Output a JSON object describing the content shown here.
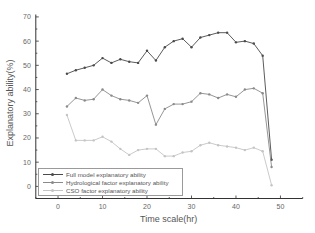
{
  "chart_data": {
    "type": "line",
    "title": "",
    "xlabel": "Time scale(hr)",
    "ylabel": "Explanatory ability(%)",
    "xlim": [
      -5,
      55
    ],
    "ylim": [
      -5,
      71
    ],
    "xticks": [
      0,
      10,
      20,
      30,
      40,
      50
    ],
    "yticks": [
      0,
      10,
      20,
      30,
      40,
      50,
      60,
      70
    ],
    "grid": false,
    "legend_position": "lower left",
    "x": [
      2,
      4,
      6,
      8,
      10,
      12,
      14,
      16,
      18,
      20,
      22,
      24,
      26,
      28,
      30,
      32,
      34,
      36,
      38,
      40,
      42,
      44,
      46,
      48
    ],
    "series": [
      {
        "name": "Full model explanatory ability",
        "color": "#4a4a4a",
        "values": [
          46.5,
          48,
          49,
          50,
          53,
          51,
          52.5,
          51.5,
          51,
          56,
          52,
          57.5,
          60,
          61,
          57.5,
          61.5,
          62.5,
          63.5,
          63.5,
          59.5,
          60,
          59,
          54,
          11
        ]
      },
      {
        "name": "Hydrological factor explanatory ability",
        "color": "#8a8a8a",
        "values": [
          33,
          36.5,
          35.5,
          36,
          40,
          37.5,
          36,
          35.5,
          34.5,
          37.5,
          25.5,
          32,
          34,
          34,
          35,
          38.5,
          38,
          36.5,
          38,
          37,
          40,
          40.5,
          38.5,
          8
        ]
      },
      {
        "name": "CSO factor explanatory ability",
        "color": "#c4c4c4",
        "values": [
          29.5,
          19,
          19,
          19,
          20.5,
          18.5,
          15.5,
          13,
          15,
          15.5,
          15.5,
          12.5,
          12.5,
          14,
          14.5,
          17,
          18,
          17,
          16.5,
          16,
          15,
          16,
          14.5,
          0.5
        ]
      }
    ]
  },
  "legend": {
    "items": [
      {
        "label": "Full model explanatory ability",
        "color": "#4a4a4a"
      },
      {
        "label": "Hydrological factor explanatory ability",
        "color": "#8a8a8a"
      },
      {
        "label": "CSO factor explanatory ability",
        "color": "#c4c4c4"
      }
    ]
  }
}
